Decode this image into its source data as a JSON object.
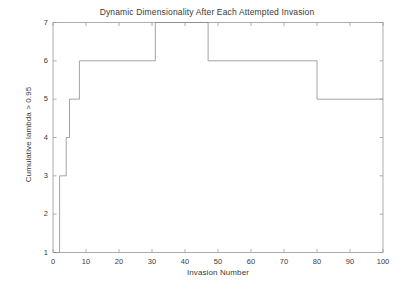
{
  "chart_data": {
    "type": "line",
    "title": "Dynamic Dimensionality After Each Attempted Invasion",
    "xlabel": "Invasion Number",
    "ylabel": "Cumulative lambda > 0.95",
    "xlim": [
      0,
      100
    ],
    "ylim": [
      1,
      7
    ],
    "xticks": [
      0,
      10,
      20,
      30,
      40,
      50,
      60,
      70,
      80,
      90,
      100
    ],
    "yticks": [
      1,
      2,
      3,
      4,
      5,
      6,
      7
    ],
    "grid": false,
    "legend": null,
    "line_color": "#888888",
    "line_width": 0.8,
    "drawstyle": "steps-post",
    "series": [
      {
        "name": "Cumulative lambda > 0.95",
        "x": [
          0,
          1,
          2,
          3,
          4,
          5,
          6,
          7,
          8,
          30,
          31,
          46,
          47,
          79,
          80,
          100
        ],
        "values": [
          1,
          1,
          3,
          3,
          4,
          5,
          5,
          5,
          6,
          6,
          7,
          7,
          6,
          6,
          5,
          5
        ]
      }
    ]
  },
  "axes": {
    "xtick_labels": [
      "0",
      "10",
      "20",
      "30",
      "40",
      "50",
      "60",
      "70",
      "80",
      "90",
      "100"
    ],
    "ytick_labels": [
      "1",
      "2",
      "3",
      "4",
      "5",
      "6",
      "7"
    ]
  },
  "colors": {
    "line": "#8c8c8c",
    "axis": "#9a9a9a",
    "text": "#3a3a3a",
    "background": "#ffffff"
  }
}
